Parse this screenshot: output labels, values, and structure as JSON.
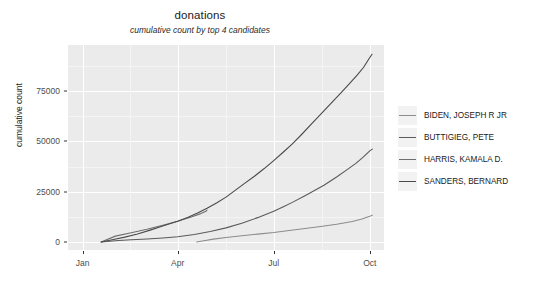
{
  "chart_data": {
    "type": "line",
    "title": "donations",
    "subtitle": "cumulative count by top 4 candidates",
    "xlabel": "",
    "ylabel": "cumulative count",
    "grid": true,
    "legend_position": "right",
    "ylim": [
      -4000,
      98000
    ],
    "yticks": [
      0,
      25000,
      50000,
      75000
    ],
    "ytick_labels": [
      "0",
      "25000",
      "50000",
      "75000"
    ],
    "y_minor_ticks": [
      12500,
      37500,
      62500,
      87500
    ],
    "xlim": [
      "2018-12-20",
      "2019-10-14"
    ],
    "xticks": [
      "Jan",
      "Apr",
      "Jul",
      "Oct"
    ],
    "xtick_positions": [
      0.046,
      0.347,
      0.651,
      0.955
    ],
    "x_minor_positions": [
      0.196,
      0.5,
      0.803
    ],
    "series": [
      {
        "name": "BIDEN, JOSEPH R JR",
        "color": "#8c8c8c",
        "points": [
          [
            0.407,
            0
          ],
          [
            0.43,
            600
          ],
          [
            0.46,
            1400
          ],
          [
            0.5,
            2200
          ],
          [
            0.55,
            3100
          ],
          [
            0.6,
            3900
          ],
          [
            0.651,
            4700
          ],
          [
            0.7,
            5700
          ],
          [
            0.75,
            6700
          ],
          [
            0.8,
            7700
          ],
          [
            0.85,
            8800
          ],
          [
            0.9,
            10200
          ],
          [
            0.93,
            11400
          ],
          [
            0.955,
            12800
          ],
          [
            0.963,
            13300
          ]
        ]
      },
      {
        "name": "BUTTIGIEG, PETE",
        "color": "#5a5a5a",
        "points": [
          [
            0.105,
            0
          ],
          [
            0.16,
            700
          ],
          [
            0.2,
            1100
          ],
          [
            0.25,
            1500
          ],
          [
            0.3,
            2000
          ],
          [
            0.347,
            2600
          ],
          [
            0.4,
            3700
          ],
          [
            0.45,
            5200
          ],
          [
            0.5,
            7000
          ],
          [
            0.55,
            9300
          ],
          [
            0.6,
            12100
          ],
          [
            0.651,
            15300
          ],
          [
            0.68,
            17400
          ],
          [
            0.71,
            19700
          ],
          [
            0.75,
            23000
          ],
          [
            0.78,
            25600
          ],
          [
            0.81,
            28200
          ],
          [
            0.85,
            32300
          ],
          [
            0.88,
            35600
          ],
          [
            0.91,
            39000
          ],
          [
            0.935,
            42300
          ],
          [
            0.955,
            45300
          ],
          [
            0.963,
            46200
          ]
        ]
      },
      {
        "name": "HARRIS, KAMALA D.",
        "color": "#6e6e6e",
        "points": [
          [
            0.105,
            0
          ],
          [
            0.15,
            2900
          ],
          [
            0.2,
            4600
          ],
          [
            0.25,
            6300
          ],
          [
            0.3,
            8300
          ],
          [
            0.347,
            10300
          ],
          [
            0.39,
            12400
          ],
          [
            0.42,
            14100
          ],
          [
            0.437,
            15300
          ],
          [
            0.44,
            15900
          ]
        ]
      },
      {
        "name": "SANDERS, BERNARD",
        "color": "#4a4a4a",
        "points": [
          [
            0.105,
            0
          ],
          [
            0.14,
            1100
          ],
          [
            0.18,
            2400
          ],
          [
            0.22,
            4000
          ],
          [
            0.26,
            5900
          ],
          [
            0.3,
            7900
          ],
          [
            0.347,
            10300
          ],
          [
            0.38,
            12300
          ],
          [
            0.41,
            14400
          ],
          [
            0.44,
            16800
          ],
          [
            0.47,
            19400
          ],
          [
            0.5,
            22300
          ],
          [
            0.53,
            25800
          ],
          [
            0.56,
            29300
          ],
          [
            0.59,
            32700
          ],
          [
            0.62,
            36400
          ],
          [
            0.651,
            40500
          ],
          [
            0.68,
            44500
          ],
          [
            0.71,
            48800
          ],
          [
            0.74,
            53600
          ],
          [
            0.77,
            58600
          ],
          [
            0.8,
            63600
          ],
          [
            0.83,
            68600
          ],
          [
            0.86,
            73600
          ],
          [
            0.89,
            78600
          ],
          [
            0.915,
            83000
          ],
          [
            0.935,
            86800
          ],
          [
            0.95,
            90500
          ],
          [
            0.962,
            93400
          ]
        ]
      }
    ]
  },
  "panel": {
    "background_color": "#ebebeb",
    "gridline_color": "#ffffff"
  }
}
